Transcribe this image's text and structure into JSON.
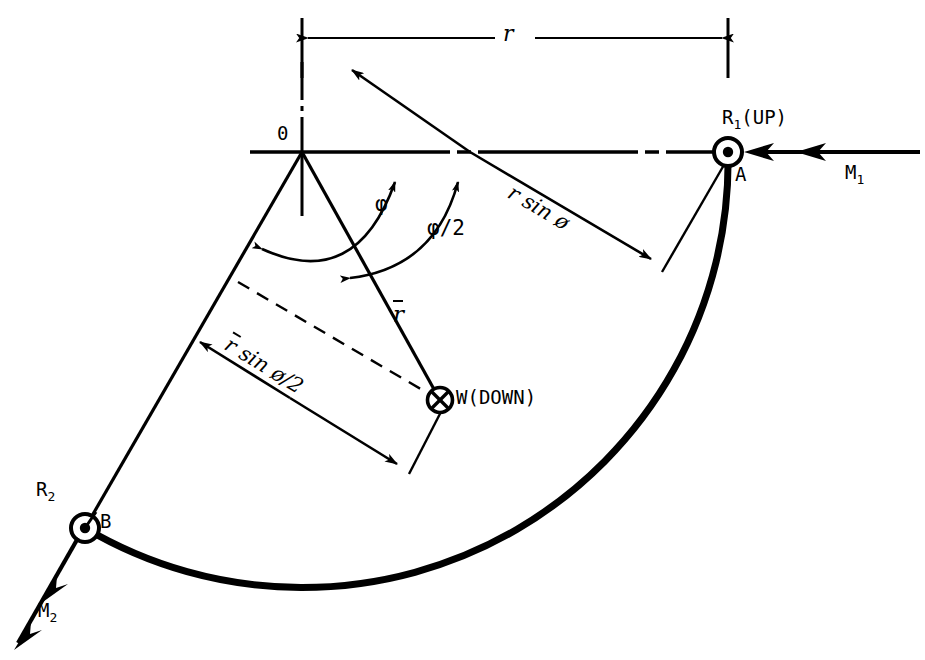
{
  "figure": {
    "type": "engineering-free-body-diagram",
    "background_color": "#ffffff",
    "line_color": "#000000",
    "width": 925,
    "height": 660
  },
  "geometry": {
    "origin": {
      "x": 302,
      "y": 152,
      "label": "0"
    },
    "point_a": {
      "x": 728,
      "y": 152,
      "label": "A"
    },
    "point_b": {
      "x": 85,
      "y": 528,
      "label": "B"
    },
    "weight_point": {
      "x": 440,
      "y": 400,
      "label": "W(DOWN)"
    },
    "radius_px": 426,
    "phi_degrees": 120,
    "arc_start_angle_deg": 0,
    "arc_end_angle_deg": 120
  },
  "labels": {
    "origin": "0",
    "radius": "r",
    "point_a": "A",
    "point_b": "B",
    "reaction_1": "R",
    "reaction_1_sub": "1",
    "reaction_1_dir": "(UP)",
    "reaction_2": "R",
    "reaction_2_sub": "2",
    "moment_1": "M",
    "moment_1_sub": "1",
    "moment_2": "M",
    "moment_2_sub": "2",
    "angle_phi": "φ",
    "angle_phi_half": "φ/2",
    "r_sin_phi_pre": "r sin ",
    "r_sin_phi_sym": "ø",
    "rbar": "r",
    "rbar_sin_pre": " sin ",
    "rbar_sin_sym": "ø/2",
    "weight": "W(DOWN)"
  },
  "markers": {
    "pin_a": "circle-dot",
    "pin_b": "circle-dot",
    "weight_marker": "circle-cross"
  },
  "colors": {
    "stroke": "#000000",
    "background": "#ffffff"
  }
}
